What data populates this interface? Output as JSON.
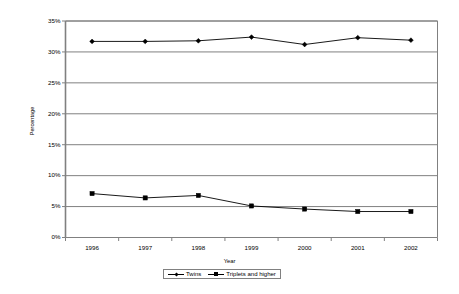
{
  "chart_data": {
    "type": "line",
    "title": "",
    "xlabel": "Year",
    "ylabel": "Percentage",
    "categories": [
      "1996",
      "1997",
      "1998",
      "1999",
      "2000",
      "2001",
      "2002"
    ],
    "series": [
      {
        "name": "Twins",
        "marker": "diamond",
        "color": "#000000",
        "values": [
          31.7,
          31.7,
          31.8,
          32.4,
          31.2,
          32.3,
          31.9
        ]
      },
      {
        "name": "Triplets and higher",
        "marker": "square",
        "color": "#000000",
        "values": [
          7.1,
          6.4,
          6.8,
          5.1,
          4.6,
          4.2,
          4.2
        ]
      }
    ],
    "ylim": [
      0,
      35
    ],
    "y_ticks": [
      "0%",
      "5%",
      "10%",
      "15%",
      "20%",
      "25%",
      "30%",
      "35%"
    ],
    "y_tick_values": [
      0,
      5,
      10,
      15,
      20,
      25,
      30,
      35
    ],
    "grid": "horizontal",
    "legend_position": "bottom",
    "legend": [
      "Twins",
      "Triplets and higher"
    ],
    "plot_border": true,
    "colors": {
      "axis": "#000000",
      "gridline": "#808080",
      "plot_border": "#808080",
      "series_line": "#000000",
      "marker": "#000000",
      "background": "#ffffff"
    }
  },
  "axis": {
    "y_title": "Percentage",
    "x_title": "Year"
  },
  "legend": {
    "items": [
      {
        "label": "Twins"
      },
      {
        "label": "Triplets and higher"
      }
    ]
  }
}
